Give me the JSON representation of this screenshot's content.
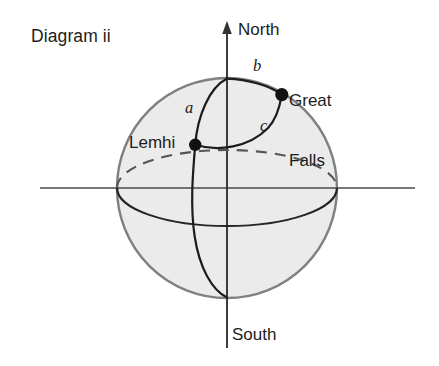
{
  "figure": {
    "title": "Diagram ii",
    "canvas": {
      "width": 439,
      "height": 366
    },
    "background_color": "#ffffff",
    "sphere": {
      "fill_color": "#ebebeb",
      "stroke_color": "#7d7d7d",
      "center_x": 227,
      "center_y": 188,
      "radius": 110
    },
    "axis_color": "#4a4a4a",
    "curve_color": "#1c1c1c",
    "point_color": "#111111"
  },
  "axes": {
    "north_label": "North",
    "south_label": "South",
    "vertical_axis_x": 227,
    "vertical_axis_top_y": 22,
    "vertical_axis_bottom_y": 348,
    "horizontal_axis_y": 188,
    "horizontal_axis_left_x": 40,
    "horizontal_axis_right_x": 415
  },
  "points": [
    {
      "name": "Lemhi",
      "label": "Lemhi",
      "x": 195,
      "y": 145
    },
    {
      "name": "Great Falls",
      "label_line1": "Great",
      "label_line2": "Falls",
      "x": 282,
      "y": 95
    }
  ],
  "curves": [
    {
      "id": "a",
      "label": "a",
      "description": "meridian arc from North pole to Lemhi"
    },
    {
      "id": "b",
      "label": "b",
      "description": "arc from North pole to Great Falls"
    },
    {
      "id": "c",
      "label": "c",
      "description": "great-circle arc from Lemhi to Great Falls"
    }
  ],
  "equator": {
    "rx": 110,
    "ry": 38,
    "back_half_style": "dashed",
    "front_half_style": "solid"
  }
}
